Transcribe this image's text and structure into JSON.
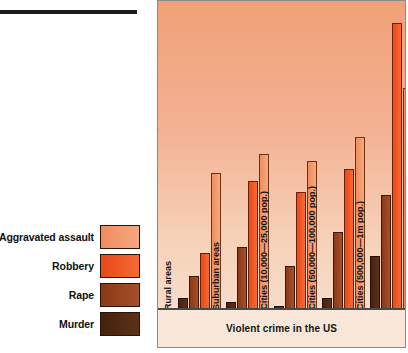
{
  "figure": {
    "title": "Violent crime in the US",
    "legend_title": "",
    "colors": {
      "aggravated_assault": "#f08a5d",
      "robbery": "#f4511e",
      "rape": "#8b3a1a",
      "murder": "#4a2410",
      "panel_background": "#f3b294",
      "axis": "#4f4f4f"
    }
  },
  "legend": {
    "items": [
      {
        "label": "Aggravated assault",
        "color": "#f08a5d",
        "key": "aggravated_assault"
      },
      {
        "label": "Robbery",
        "color": "#f4511e",
        "key": "robbery"
      },
      {
        "label": "Rape",
        "color": "#8b3a1a",
        "key": "rape"
      },
      {
        "label": "Murder",
        "color": "#4a2410",
        "key": "murder"
      }
    ]
  },
  "yaxis": {
    "ticks_lower": [
      "10",
      "20",
      "30",
      "40",
      "50",
      "60",
      "70",
      "80",
      "90",
      "100"
    ],
    "ticks_upper": [
      "200",
      "300",
      "400",
      "500",
      "600"
    ],
    "has_break": true,
    "break_between": [
      "100",
      "200"
    ]
  },
  "chart_data": {
    "type": "bar",
    "title": "Violent crime in the US",
    "xlabel": "Violent crime in the US",
    "ylabel": "",
    "grid": false,
    "legend_position": "left-outside",
    "axis_break": {
      "between": [
        100,
        200
      ],
      "lower_scale": "log-like",
      "upper_scale": "linear"
    },
    "yticks": [
      10,
      20,
      30,
      40,
      50,
      60,
      70,
      80,
      90,
      100,
      200,
      300,
      400,
      500,
      600
    ],
    "ylim": [
      0,
      650
    ],
    "categories": [
      "Rural areas",
      "Suburban areas",
      "Cities (10,000—25,000 pop.)",
      "Cities (50,000—100,000 pop.)",
      "Cities (500,000—1m pop.)"
    ],
    "series": [
      {
        "name": "Murder",
        "color": "#4a2410",
        "values": [
          7,
          5,
          3,
          7,
          21
        ]
      },
      {
        "name": "Rape",
        "color": "#8b3a1a",
        "values": [
          14,
          25,
          17,
          34,
          72
        ]
      },
      {
        "name": "Robbery",
        "color": "#f4511e",
        "values": [
          22,
          97,
          76,
          175,
          600
        ]
      },
      {
        "name": "Aggravated assault",
        "color": "#f08a5d",
        "values": [
          145,
          230,
          212,
          280,
          418
        ]
      }
    ]
  }
}
